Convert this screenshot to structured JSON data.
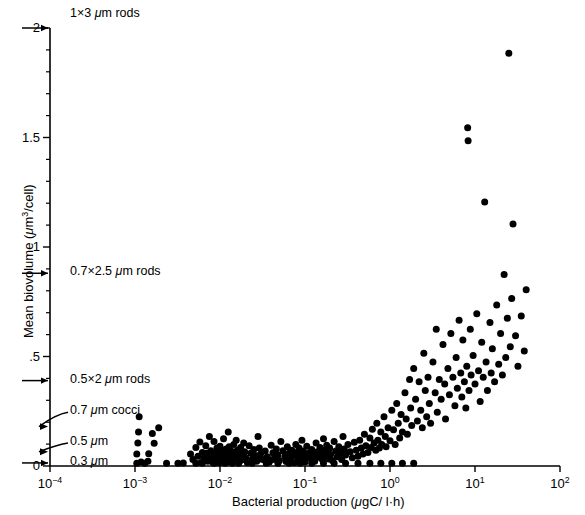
{
  "chart_data": {
    "type": "scatter",
    "title": "",
    "xlabel": "Bacterial production (μgC/ l·h)",
    "ylabel": "Mean biovolume (μm³/cell)",
    "xscale": "log",
    "yscale": "linear",
    "xlim": [
      0.0001,
      100
    ],
    "ylim": [
      0,
      2
    ],
    "grid": false,
    "legend": null,
    "xticks": [
      {
        "value": 0.0001,
        "label": "10⁻⁴",
        "mantissa": "10",
        "exponent": "-4"
      },
      {
        "value": 0.001,
        "label": "10⁻³",
        "mantissa": "10",
        "exponent": "-3"
      },
      {
        "value": 0.01,
        "label": "10⁻²",
        "mantissa": "10",
        "exponent": "-2"
      },
      {
        "value": 0.1,
        "label": "10⁻¹",
        "mantissa": "10",
        "exponent": "-1"
      },
      {
        "value": 1,
        "label": "10⁰",
        "mantissa": "10",
        "exponent": "0"
      },
      {
        "value": 10,
        "label": "10¹",
        "mantissa": "10",
        "exponent": "1"
      },
      {
        "value": 100,
        "label": "10²",
        "mantissa": "10",
        "exponent": "2"
      }
    ],
    "yticks_major": [
      {
        "value": 0,
        "label": "0"
      },
      {
        "value": 0.5,
        "label": ".5"
      },
      {
        "value": 1,
        "label": "1"
      },
      {
        "value": 1.5,
        "label": "1.5"
      },
      {
        "value": 2,
        "label": "2"
      }
    ],
    "yticks_minor": [
      0.1,
      0.2,
      0.3,
      0.4,
      0.6,
      0.7,
      0.8,
      0.9,
      1.1,
      1.2,
      1.3,
      1.4,
      1.6,
      1.7,
      1.8,
      1.9
    ],
    "annotations": [
      {
        "id": "rods-1x3",
        "label": "1×3 μm rods",
        "y_value": 2.0,
        "arrow": "straight"
      },
      {
        "id": "rods-07x25",
        "label": "0.7×2.5 μm rods",
        "y_value": 0.88,
        "arrow": "straight"
      },
      {
        "id": "rods-05x2",
        "label": "0.5×2 μm rods",
        "y_value": 0.39,
        "arrow": "straight"
      },
      {
        "id": "cocci-07",
        "label": "0.7 μm cocci",
        "y_value": 0.18,
        "arrow": "bent"
      },
      {
        "id": "cocci-05",
        "label": "0.5 μm",
        "y_value": 0.065,
        "arrow": "bent"
      },
      {
        "id": "cocci-03",
        "label": "0.3 μm",
        "y_value": 0.014,
        "arrow": "straight"
      }
    ],
    "marker": {
      "shape": "circle",
      "color": "#000000",
      "size_px": 7
    },
    "n_points": 262,
    "points": [
      [
        0.00105,
        0.055
      ],
      [
        0.00105,
        0.012
      ],
      [
        0.00108,
        0.105
      ],
      [
        0.0011,
        0.155
      ],
      [
        0.00112,
        0.225
      ],
      [
        0.00118,
        0.018
      ],
      [
        0.0013,
        0.012
      ],
      [
        0.00142,
        0.022
      ],
      [
        0.00145,
        0.056
      ],
      [
        0.0016,
        0.148
      ],
      [
        0.00168,
        0.104
      ],
      [
        0.0019,
        0.175
      ],
      [
        0.00235,
        0.012
      ],
      [
        0.0032,
        0.012
      ],
      [
        0.0037,
        0.014
      ],
      [
        0.0045,
        0.055
      ],
      [
        0.0048,
        0.03
      ],
      [
        0.0052,
        0.085
      ],
      [
        0.0055,
        0.045
      ],
      [
        0.0058,
        0.11
      ],
      [
        0.006,
        0.016
      ],
      [
        0.0062,
        0.062
      ],
      [
        0.0065,
        0.036
      ],
      [
        0.0068,
        0.092
      ],
      [
        0.007,
        0.058
      ],
      [
        0.0072,
        0.022
      ],
      [
        0.0075,
        0.135
      ],
      [
        0.0078,
        0.07
      ],
      [
        0.008,
        0.04
      ],
      [
        0.0082,
        0.018
      ],
      [
        0.0085,
        0.112
      ],
      [
        0.0088,
        0.062
      ],
      [
        0.009,
        0.03
      ],
      [
        0.0092,
        0.082
      ],
      [
        0.0095,
        0.052
      ],
      [
        0.0098,
        0.015
      ],
      [
        0.01,
        0.09
      ],
      [
        0.0102,
        0.042
      ],
      [
        0.0105,
        0.068
      ],
      [
        0.0108,
        0.025
      ],
      [
        0.011,
        0.125
      ],
      [
        0.0112,
        0.055
      ],
      [
        0.0115,
        0.032
      ],
      [
        0.0118,
        0.078
      ],
      [
        0.012,
        0.048
      ],
      [
        0.0122,
        0.018
      ],
      [
        0.0125,
        0.155
      ],
      [
        0.0128,
        0.088
      ],
      [
        0.013,
        0.058
      ],
      [
        0.0132,
        0.028
      ],
      [
        0.0135,
        0.068
      ],
      [
        0.0138,
        0.04
      ],
      [
        0.014,
        0.012
      ],
      [
        0.0145,
        0.098
      ],
      [
        0.015,
        0.06
      ],
      [
        0.0152,
        0.035
      ],
      [
        0.0155,
        0.118
      ],
      [
        0.016,
        0.072
      ],
      [
        0.0165,
        0.045
      ],
      [
        0.017,
        0.02
      ],
      [
        0.0175,
        0.085
      ],
      [
        0.018,
        0.055
      ],
      [
        0.0185,
        0.03
      ],
      [
        0.019,
        0.105
      ],
      [
        0.0195,
        0.065
      ],
      [
        0.02,
        0.038
      ],
      [
        0.021,
        0.015
      ],
      [
        0.022,
        0.092
      ],
      [
        0.023,
        0.058
      ],
      [
        0.024,
        0.032
      ],
      [
        0.025,
        0.075
      ],
      [
        0.026,
        0.048
      ],
      [
        0.027,
        0.022
      ],
      [
        0.028,
        0.135
      ],
      [
        0.029,
        0.082
      ],
      [
        0.03,
        0.055
      ],
      [
        0.032,
        0.03
      ],
      [
        0.034,
        0.068
      ],
      [
        0.036,
        0.042
      ],
      [
        0.038,
        0.018
      ],
      [
        0.04,
        0.095
      ],
      [
        0.042,
        0.06
      ],
      [
        0.044,
        0.035
      ],
      [
        0.046,
        0.078
      ],
      [
        0.048,
        0.05
      ],
      [
        0.05,
        0.025
      ],
      [
        0.052,
        0.112
      ],
      [
        0.055,
        0.07
      ],
      [
        0.058,
        0.045
      ],
      [
        0.06,
        0.02
      ],
      [
        0.062,
        0.088
      ],
      [
        0.065,
        0.058
      ],
      [
        0.068,
        0.032
      ],
      [
        0.07,
        0.072
      ],
      [
        0.072,
        0.048
      ],
      [
        0.075,
        0.015
      ],
      [
        0.078,
        0.098
      ],
      [
        0.08,
        0.062
      ],
      [
        0.082,
        0.038
      ],
      [
        0.085,
        0.082
      ],
      [
        0.088,
        0.052
      ],
      [
        0.09,
        0.028
      ],
      [
        0.092,
        0.118
      ],
      [
        0.095,
        0.068
      ],
      [
        0.098,
        0.042
      ],
      [
        0.1,
        0.018
      ],
      [
        0.105,
        0.09
      ],
      [
        0.11,
        0.058
      ],
      [
        0.115,
        0.035
      ],
      [
        0.12,
        0.075
      ],
      [
        0.125,
        0.048
      ],
      [
        0.13,
        0.022
      ],
      [
        0.135,
        0.105
      ],
      [
        0.14,
        0.065
      ],
      [
        0.145,
        0.04
      ],
      [
        0.15,
        0.085
      ],
      [
        0.155,
        0.055
      ],
      [
        0.16,
        0.03
      ],
      [
        0.165,
        0.125
      ],
      [
        0.17,
        0.072
      ],
      [
        0.175,
        0.045
      ],
      [
        0.18,
        0.095
      ],
      [
        0.185,
        0.06
      ],
      [
        0.19,
        0.032
      ],
      [
        0.195,
        0.082
      ],
      [
        0.2,
        0.052
      ],
      [
        0.21,
        0.025
      ],
      [
        0.22,
        0.112
      ],
      [
        0.23,
        0.068
      ],
      [
        0.24,
        0.042
      ],
      [
        0.25,
        0.088
      ],
      [
        0.26,
        0.058
      ],
      [
        0.27,
        0.03
      ],
      [
        0.28,
        0.135
      ],
      [
        0.29,
        0.078
      ],
      [
        0.3,
        0.05
      ],
      [
        0.32,
        0.098
      ],
      [
        0.34,
        0.065
      ],
      [
        0.36,
        0.038
      ],
      [
        0.38,
        0.108
      ],
      [
        0.4,
        0.072
      ],
      [
        0.42,
        0.045
      ],
      [
        0.44,
        0.118
      ],
      [
        0.46,
        0.082
      ],
      [
        0.48,
        0.055
      ],
      [
        0.5,
        0.145
      ],
      [
        0.52,
        0.092
      ],
      [
        0.55,
        0.062
      ],
      [
        0.58,
        0.128
      ],
      [
        0.6,
        0.085
      ],
      [
        0.62,
        0.168
      ],
      [
        0.65,
        0.105
      ],
      [
        0.68,
        0.072
      ],
      [
        0.7,
        0.195
      ],
      [
        0.72,
        0.118
      ],
      [
        0.75,
        0.082
      ],
      [
        0.78,
        0.155
      ],
      [
        0.8,
        0.098
      ],
      [
        0.85,
        0.225
      ],
      [
        0.88,
        0.135
      ],
      [
        0.9,
        0.088
      ],
      [
        0.95,
        0.175
      ],
      [
        1.0,
        0.115
      ],
      [
        1.05,
        0.255
      ],
      [
        1.1,
        0.165
      ],
      [
        1.15,
        0.098
      ],
      [
        1.2,
        0.285
      ],
      [
        1.25,
        0.195
      ],
      [
        1.3,
        0.128
      ],
      [
        1.35,
        0.235
      ],
      [
        1.4,
        0.155
      ],
      [
        1.5,
        0.335
      ],
      [
        1.55,
        0.215
      ],
      [
        1.6,
        0.145
      ],
      [
        1.7,
        0.395
      ],
      [
        1.75,
        0.265
      ],
      [
        1.8,
        0.185
      ],
      [
        1.9,
        0.445
      ],
      [
        2.0,
        0.305
      ],
      [
        2.1,
        0.205
      ],
      [
        2.2,
        0.385
      ],
      [
        2.3,
        0.255
      ],
      [
        2.4,
        0.175
      ],
      [
        2.5,
        0.515
      ],
      [
        2.6,
        0.345
      ],
      [
        2.7,
        0.225
      ],
      [
        2.8,
        0.405
      ],
      [
        2.9,
        0.285
      ],
      [
        3.0,
        0.195
      ],
      [
        3.2,
        0.475
      ],
      [
        3.4,
        0.335
      ],
      [
        3.5,
        0.625
      ],
      [
        3.6,
        0.245
      ],
      [
        3.8,
        0.395
      ],
      [
        4.0,
        0.305
      ],
      [
        4.2,
        0.555
      ],
      [
        4.4,
        0.375
      ],
      [
        4.5,
        0.215
      ],
      [
        4.8,
        0.445
      ],
      [
        5.0,
        0.325
      ],
      [
        5.2,
        0.605
      ],
      [
        5.5,
        0.405
      ],
      [
        5.8,
        0.275
      ],
      [
        6.0,
        0.495
      ],
      [
        6.2,
        0.355
      ],
      [
        6.5,
        0.665
      ],
      [
        6.8,
        0.425
      ],
      [
        7.0,
        0.315
      ],
      [
        7.2,
        0.575
      ],
      [
        7.5,
        0.385
      ],
      [
        7.8,
        0.265
      ],
      [
        8.0,
        0.455
      ],
      [
        8.2,
        1.545
      ],
      [
        8.3,
        1.485
      ],
      [
        8.5,
        0.345
      ],
      [
        8.8,
        0.625
      ],
      [
        9.0,
        0.415
      ],
      [
        9.5,
        0.505
      ],
      [
        10.0,
        0.375
      ],
      [
        10.5,
        0.695
      ],
      [
        11.0,
        0.435
      ],
      [
        11.5,
        0.295
      ],
      [
        12.0,
        0.565
      ],
      [
        12.5,
        0.405
      ],
      [
        13.0,
        1.205
      ],
      [
        13.5,
        0.475
      ],
      [
        14.0,
        0.345
      ],
      [
        15.0,
        0.655
      ],
      [
        15.5,
        0.425
      ],
      [
        16.0,
        0.535
      ],
      [
        17.0,
        0.385
      ],
      [
        18.0,
        0.735
      ],
      [
        19.0,
        0.465
      ],
      [
        20.0,
        0.605
      ],
      [
        21.0,
        0.415
      ],
      [
        22.0,
        0.875
      ],
      [
        23.0,
        0.495
      ],
      [
        24.0,
        0.675
      ],
      [
        25.0,
        1.885
      ],
      [
        26.0,
        0.545
      ],
      [
        27.0,
        0.765
      ],
      [
        28.0,
        1.105
      ],
      [
        30.0,
        0.595
      ],
      [
        32.0,
        0.455
      ],
      [
        35.0,
        0.685
      ],
      [
        38.0,
        0.525
      ],
      [
        40.0,
        0.805
      ],
      [
        0.0052,
        0.012
      ],
      [
        0.0062,
        0.012
      ],
      [
        0.0085,
        0.012
      ],
      [
        0.0115,
        0.012
      ],
      [
        0.0165,
        0.012
      ],
      [
        0.024,
        0.012
      ],
      [
        0.035,
        0.012
      ],
      [
        0.048,
        0.012
      ],
      [
        0.065,
        0.012
      ],
      [
        0.088,
        0.012
      ],
      [
        0.12,
        0.012
      ],
      [
        0.165,
        0.012
      ],
      [
        0.22,
        0.012
      ],
      [
        0.3,
        0.012
      ],
      [
        0.42,
        0.012
      ],
      [
        0.58,
        0.012
      ],
      [
        0.78,
        0.012
      ],
      [
        1.05,
        0.012
      ],
      [
        1.4,
        0.012
      ],
      [
        1.9,
        0.012
      ],
      [
        0.0072,
        0.03
      ],
      [
        0.0098,
        0.03
      ],
      [
        0.0135,
        0.03
      ],
      [
        0.019,
        0.03
      ],
      [
        0.028,
        0.03
      ],
      [
        0.042,
        0.03
      ],
      [
        0.06,
        0.03
      ],
      [
        0.085,
        0.03
      ]
    ]
  }
}
